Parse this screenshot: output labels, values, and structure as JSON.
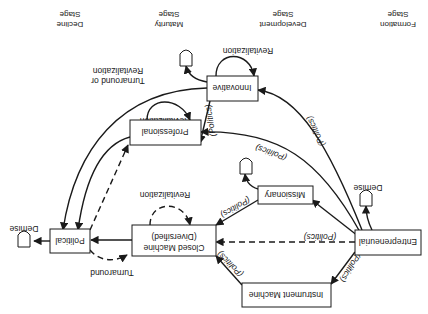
{
  "orientation": "rotated-180",
  "stages": [
    {
      "id": "formation",
      "line1": "Formation",
      "line2": "Stage"
    },
    {
      "id": "development",
      "line1": "Development",
      "line2": "Stage"
    },
    {
      "id": "maturity",
      "line1": "Maturity",
      "line2": "Stage"
    },
    {
      "id": "decline",
      "line1": "Decline",
      "line2": "Stage"
    }
  ],
  "nodes": {
    "entrepreneurial": "Entrepreneurial",
    "instrument_machine": "Instrument Machine",
    "missionary": "Missionary",
    "closed_machine_1": "Closed Machine",
    "closed_machine_2": "(Diversified)",
    "political": "Political",
    "professional": "Professional",
    "innovative": "Innovative"
  },
  "edge_labels": {
    "politics": "(Politics)",
    "revitalization": "Revitalization",
    "turnaround": "Turnaround",
    "turnaround_or_1": "Turnaround or",
    "turnaround_or_2": "Revitalization",
    "demise": "Demise"
  },
  "colors": {
    "ink": "#1a1a1a",
    "background": "#ffffff"
  }
}
